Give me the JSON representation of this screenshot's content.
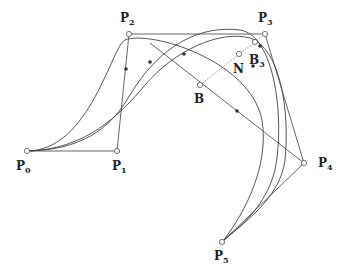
{
  "diagram": {
    "title": "",
    "control_points": [
      {
        "id": "P0",
        "label": "P",
        "sub": "0",
        "x": 27,
        "y": 151,
        "lx": 16,
        "ly": 170
      },
      {
        "id": "P1",
        "label": "P",
        "sub": "1",
        "x": 117,
        "y": 151,
        "lx": 112,
        "ly": 170
      },
      {
        "id": "P2",
        "label": "P",
        "sub": "2",
        "x": 129,
        "y": 34,
        "lx": 120,
        "ly": 22
      },
      {
        "id": "P3",
        "label": "P",
        "sub": "3",
        "x": 265,
        "y": 34,
        "lx": 258,
        "ly": 22
      },
      {
        "id": "P4",
        "label": "P",
        "sub": "4",
        "x": 304,
        "y": 163,
        "lx": 318,
        "ly": 167
      },
      {
        "id": "P5",
        "label": "P",
        "sub": "5",
        "x": 222,
        "y": 242,
        "lx": 214,
        "ly": 260
      }
    ],
    "special_points": [
      {
        "id": "B",
        "label": "B",
        "sub": "",
        "x": 200,
        "y": 85,
        "lx": 194,
        "ly": 103
      },
      {
        "id": "N",
        "label": "N",
        "sub": "",
        "x": 239,
        "y": 54,
        "lx": 233,
        "ly": 73
      },
      {
        "id": "B3",
        "label": "B",
        "sub": "3",
        "x": 255,
        "y": 42,
        "lx": 249,
        "ly": 64
      }
    ],
    "filled_points": [
      {
        "x": 126,
        "y": 69
      },
      {
        "x": 150,
        "y": 62
      },
      {
        "x": 184,
        "y": 54
      },
      {
        "x": 260,
        "y": 46
      },
      {
        "x": 253,
        "y": 66
      },
      {
        "x": 237,
        "y": 111
      }
    ],
    "curves": [
      "M27,151 C90,151 112,45 125,40 C150,30 250,60 262,120 C270,170 240,220 222,242",
      "M27,151 C80,150 110,130 130,95 C160,45 200,25 240,30 C275,35 285,120 275,170 C265,210 235,230 222,242",
      "M27,151 C85,150 120,115 145,85 C175,50 220,30 250,38 C280,48 290,110 285,160 C280,200 240,225 222,242"
    ],
    "line_B_to_B3": {
      "x1": 200,
      "y1": 85,
      "x2": 255,
      "y2": 42
    }
  }
}
